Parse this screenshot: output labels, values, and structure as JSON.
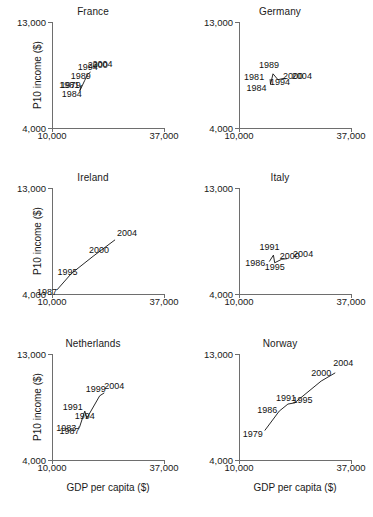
{
  "figure": {
    "axis_titles": {
      "y": "P10 income ($)",
      "x": "GDP per capita ($)"
    },
    "x_ticks": [
      "10,000",
      "37,000"
    ],
    "y_ticks": [
      "4,000",
      "13,000"
    ]
  },
  "chart_data": {
    "type": "scatter",
    "title": "",
    "xlabel": "GDP per capita ($)",
    "ylabel": "P10 income ($)",
    "xlim": [
      10000,
      37000
    ],
    "ylim": [
      4000,
      13000
    ],
    "xticks": [
      10000,
      37000
    ],
    "yticks": [
      4000,
      13000
    ],
    "xticklabels": [
      "10,000",
      "37,000"
    ],
    "yticklabels": [
      "4,000",
      "13,000"
    ],
    "grid": false,
    "legend": false,
    "connected": true,
    "point_labels": "year",
    "layout": {
      "rows": 3,
      "cols": 2
    },
    "panels": [
      {
        "name": "France",
        "row": 0,
        "col": 0,
        "points": [
          {
            "label": "1984",
            "x": 16700,
            "y": 7150
          },
          {
            "label": "1979",
            "x": 16900,
            "y": 7500
          },
          {
            "label": "1981",
            "x": 17050,
            "y": 7620
          },
          {
            "label": "1989",
            "x": 17900,
            "y": 8050
          },
          {
            "label": "1994",
            "x": 18600,
            "y": 8550
          },
          {
            "label": "2000",
            "x": 19100,
            "y": 8700
          },
          {
            "label": "2004",
            "x": 19300,
            "y": 8750
          }
        ]
      },
      {
        "name": "Germany",
        "row": 0,
        "col": 1,
        "points": [
          {
            "label": "1984",
            "x": 17600,
            "y": 7700
          },
          {
            "label": "1981",
            "x": 17500,
            "y": 8150
          },
          {
            "label": "1989",
            "x": 18200,
            "y": 8600
          },
          {
            "label": "1994",
            "x": 19400,
            "y": 8100
          },
          {
            "label": "2000",
            "x": 20600,
            "y": 8200
          },
          {
            "label": "2004",
            "x": 21300,
            "y": 8180
          }
        ]
      },
      {
        "name": "Ireland",
        "row": 1,
        "col": 0,
        "points": [
          {
            "label": "1987",
            "x": 11200,
            "y": 4350
          },
          {
            "label": "1995",
            "x": 14700,
            "y": 5750
          },
          {
            "label": "2000",
            "x": 19900,
            "y": 7200
          },
          {
            "label": "2004",
            "x": 25200,
            "y": 8600
          }
        ]
      },
      {
        "name": "Italy",
        "row": 1,
        "col": 1,
        "points": [
          {
            "label": "1986",
            "x": 17300,
            "y": 6750
          },
          {
            "label": "1995",
            "x": 18600,
            "y": 6650
          },
          {
            "label": "1991",
            "x": 18300,
            "y": 7300
          },
          {
            "label": "2000",
            "x": 20300,
            "y": 6950
          },
          {
            "label": "2004",
            "x": 21600,
            "y": 7000
          }
        ]
      },
      {
        "name": "Netherlands",
        "row": 2,
        "col": 0,
        "points": [
          {
            "label": "1983",
            "x": 16300,
            "y": 6800
          },
          {
            "label": "1987",
            "x": 16600,
            "y": 6750
          },
          {
            "label": "1994",
            "x": 18400,
            "y": 7550
          },
          {
            "label": "1991",
            "x": 17900,
            "y": 8150
          },
          {
            "label": "1999",
            "x": 21500,
            "y": 9450
          },
          {
            "label": "2004",
            "x": 22600,
            "y": 9700
          }
        ]
      },
      {
        "name": "Norway",
        "row": 2,
        "col": 1,
        "points": [
          {
            "label": "1979",
            "x": 16200,
            "y": 6500
          },
          {
            "label": "1986",
            "x": 19700,
            "y": 8150
          },
          {
            "label": "1991",
            "x": 21800,
            "y": 8750
          },
          {
            "label": "1995",
            "x": 23400,
            "y": 8850
          },
          {
            "label": "2000",
            "x": 29800,
            "y": 10700
          },
          {
            "label": "2004",
            "x": 33200,
            "y": 11400
          }
        ]
      }
    ]
  }
}
